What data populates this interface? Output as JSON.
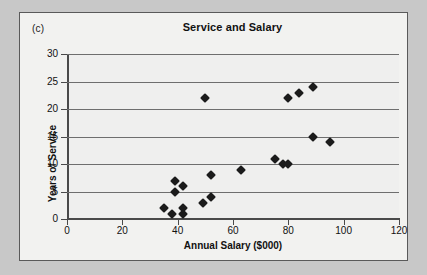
{
  "panel": {
    "label": "(c)"
  },
  "chart_data": {
    "type": "scatter",
    "title": "Service and Salary",
    "xlabel": "Annual Salary ($000)",
    "ylabel": "Years of Service",
    "xlim": [
      0,
      120
    ],
    "ylim": [
      0,
      30
    ],
    "xticks": [
      0,
      20,
      40,
      60,
      80,
      100,
      120
    ],
    "yticks": [
      0,
      5,
      10,
      15,
      20,
      25,
      30
    ],
    "grid": "horizontal",
    "legend": "none",
    "marker": "filled-diamond",
    "marker_color": "#1b1b1b",
    "plot_bg": "#efefee",
    "points": [
      {
        "x": 35,
        "y": 2
      },
      {
        "x": 38,
        "y": 1
      },
      {
        "x": 39,
        "y": 5
      },
      {
        "x": 39,
        "y": 7
      },
      {
        "x": 42,
        "y": 1
      },
      {
        "x": 42,
        "y": 2
      },
      {
        "x": 42,
        "y": 6
      },
      {
        "x": 49,
        "y": 3
      },
      {
        "x": 50,
        "y": 22
      },
      {
        "x": 52,
        "y": 4
      },
      {
        "x": 52,
        "y": 8
      },
      {
        "x": 63,
        "y": 9
      },
      {
        "x": 75,
        "y": 11
      },
      {
        "x": 78,
        "y": 10
      },
      {
        "x": 80,
        "y": 10
      },
      {
        "x": 80,
        "y": 22
      },
      {
        "x": 84,
        "y": 23
      },
      {
        "x": 89,
        "y": 15
      },
      {
        "x": 89,
        "y": 24
      },
      {
        "x": 95,
        "y": 14
      }
    ]
  }
}
